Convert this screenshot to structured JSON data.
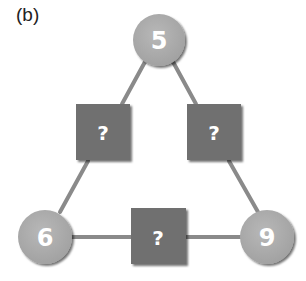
{
  "figure": {
    "label": "(b)",
    "colors": {
      "circle_fill": "#a9a9a9",
      "square_fill": "#6f6f6f",
      "line": "#8a8a8a",
      "text": "#ffffff"
    },
    "nodes": {
      "top": "5",
      "bottom_left": "6",
      "bottom_right": "9"
    },
    "unknowns": {
      "left": "?",
      "right": "?",
      "bottom": "?"
    }
  }
}
